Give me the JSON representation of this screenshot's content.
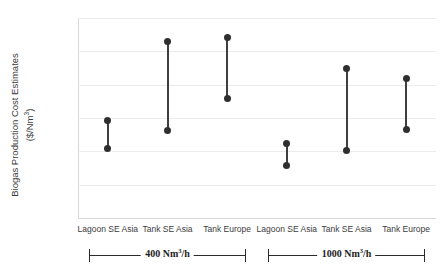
{
  "chart_data": {
    "type": "scatter",
    "title": "",
    "xlabel": "",
    "ylabel_line1": "Biogas Production Cost Estimates",
    "ylabel_line2": "($/Nm³)",
    "ylim": [
      0,
      0.3
    ],
    "yticks": [
      "0",
      "0.05",
      "0.1",
      "0.15",
      "0.2",
      "0.25",
      "0.3"
    ],
    "ytick_values": [
      0,
      0.05,
      0.1,
      0.15,
      0.2,
      0.25,
      0.3
    ],
    "grid": true,
    "legend": "none",
    "categories": [
      "Lagoon SE Asia",
      "Tank SE Asia",
      "Tank Europe",
      "Lagoon SE Asia",
      "Tank SE Asia",
      "Tank Europe"
    ],
    "series": [
      {
        "name": "range-low",
        "values": [
          0.104,
          0.132,
          0.18,
          0.079,
          0.101,
          0.133
        ]
      },
      {
        "name": "range-high",
        "values": [
          0.146,
          0.265,
          0.271,
          0.112,
          0.225,
          0.209
        ]
      }
    ],
    "groups": [
      {
        "label": "400 Nm³/h",
        "categories": [
          0,
          1,
          2
        ]
      },
      {
        "label": "1000 Nm³/h",
        "categories": [
          3,
          4,
          5
        ]
      }
    ],
    "marker_color": "#2f2f2f",
    "line_color": "#3f3f3f",
    "grid_color": "#eceaea"
  }
}
